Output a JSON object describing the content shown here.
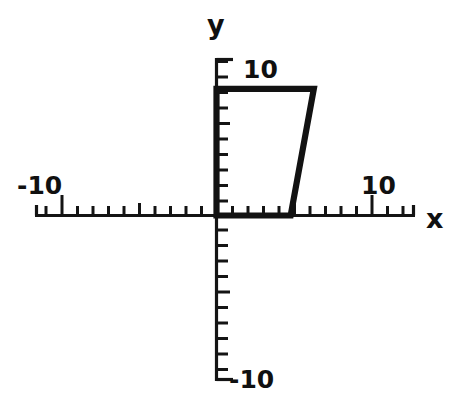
{
  "figure": {
    "background_color": "#ffffff",
    "ink_color": "#121212"
  },
  "axes": {
    "x_label": "x",
    "y_label": "y",
    "x_positive_tick_label": "10",
    "x_negative_tick_label": "-10",
    "y_positive_tick_label": "10",
    "y_negative_tick_label": "-10"
  },
  "chart_data": {
    "type": "line",
    "title": "",
    "xlabel": "x",
    "ylabel": "y",
    "xlim": [
      -11.7,
      12.9
    ],
    "ylim": [
      -10.7,
      10.2
    ],
    "grid": false,
    "legend": null,
    "xticks": [
      -11,
      -10,
      -9,
      -8,
      -7,
      -6,
      -5,
      -4,
      -3,
      -2,
      -1,
      0,
      1,
      2,
      3,
      4,
      5,
      6,
      7,
      8,
      9,
      10,
      11,
      12
    ],
    "yticks": [
      -10,
      -9,
      -8,
      -7,
      -6,
      -5,
      -4,
      -3,
      -2,
      -1,
      0,
      1,
      2,
      3,
      4,
      5,
      6,
      7,
      8,
      9,
      10
    ],
    "xtick_labels": [
      {
        "value": -10,
        "text": "-10"
      },
      {
        "value": 10,
        "text": "10"
      }
    ],
    "ytick_labels": [
      {
        "value": 10,
        "text": "10"
      },
      {
        "value": -10,
        "text": "-10"
      }
    ],
    "major_tick_values_x": [
      -10,
      10
    ],
    "major_tick_values_y": [],
    "series": [
      {
        "name": "trapezoid",
        "type": "closed_polygon",
        "closed": true,
        "fill": "none",
        "stroke": "#121212",
        "x": [
          0,
          0,
          6.3,
          4.8
        ],
        "y": [
          0,
          8.2,
          8.2,
          0
        ],
        "vertices": [
          {
            "x": 0,
            "y": 0
          },
          {
            "x": 0,
            "y": 8.2
          },
          {
            "x": 6.3,
            "y": 8.2
          },
          {
            "x": 4.8,
            "y": 0
          }
        ]
      }
    ]
  }
}
